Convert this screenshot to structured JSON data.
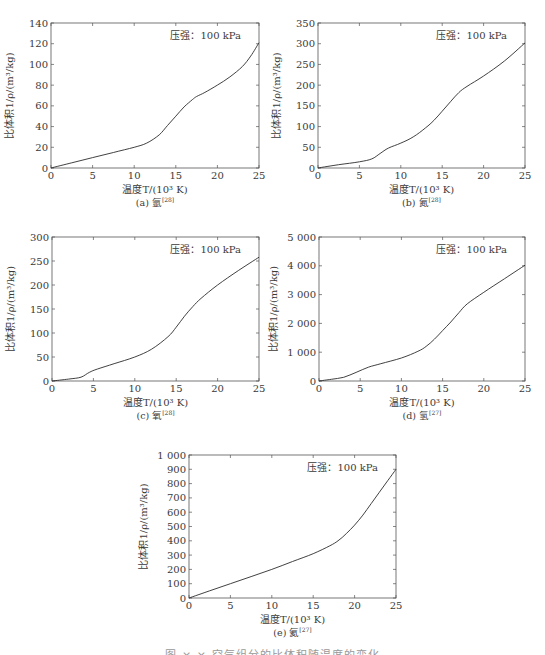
{
  "figure_caption": "图 ×-× 空气组分的比体积随温度的变化",
  "chart_data": [
    {
      "id": "a",
      "type": "line",
      "caption_label": "(a) 氩",
      "caption_ref": "[28]",
      "annotation": "压强：100 kPa",
      "xlabel": "温度T/(10³ K)",
      "ylabel": "比体积1/ρ/(m³/kg)",
      "xlim": [
        0,
        25
      ],
      "ylim": [
        0,
        140
      ],
      "xticks": [
        0,
        5,
        10,
        15,
        20,
        25
      ],
      "yticks": [
        0,
        20,
        40,
        60,
        80,
        100,
        120,
        140
      ],
      "ytick_labels": [
        "0",
        "20",
        "40",
        "60",
        "80",
        "100",
        "120",
        "140"
      ],
      "x": [
        0,
        2.5,
        5,
        7.5,
        10,
        11.5,
        13,
        14,
        15,
        16,
        17,
        17.5,
        18.5,
        20,
        21.5,
        23,
        24,
        25
      ],
      "y": [
        0,
        5,
        10,
        15,
        20,
        24,
        32,
        41,
        50,
        59,
        66,
        69,
        73,
        80,
        88,
        98,
        108,
        121
      ],
      "grid": false
    },
    {
      "id": "b",
      "type": "line",
      "caption_label": "(b) 氮",
      "caption_ref": "[28]",
      "annotation": "压强：100 kPa",
      "xlabel": "温度T/(10³ K)",
      "ylabel": "比体积1/ρ/(m³/kg)",
      "xlim": [
        0,
        25
      ],
      "ylim": [
        0,
        350
      ],
      "xticks": [
        0,
        5,
        10,
        15,
        20,
        25
      ],
      "yticks": [
        0,
        50,
        100,
        150,
        200,
        250,
        300,
        350
      ],
      "ytick_labels": [
        "0",
        "50",
        "100",
        "150",
        "200",
        "250",
        "300",
        "350"
      ],
      "x": [
        0,
        2.5,
        5,
        6.5,
        7.5,
        8.5,
        10,
        11.5,
        13,
        14,
        15,
        16,
        17,
        18,
        20,
        22.5,
        25
      ],
      "y": [
        0,
        8,
        15,
        22,
        35,
        48,
        60,
        75,
        97,
        115,
        137,
        160,
        182,
        197,
        222,
        258,
        302
      ],
      "grid": false
    },
    {
      "id": "c",
      "type": "line",
      "caption_label": "(c) 氧",
      "caption_ref": "[28]",
      "annotation": "压强：100 kPa",
      "xlabel": "温度T/(10³ K)",
      "ylabel": "比体积1/ρ/(m³/kg)",
      "xlim": [
        0,
        25
      ],
      "ylim": [
        0,
        300
      ],
      "xticks": [
        0,
        5,
        10,
        15,
        20,
        25
      ],
      "yticks": [
        0,
        50,
        100,
        150,
        200,
        250,
        300
      ],
      "ytick_labels": [
        "0",
        "50",
        "100",
        "150",
        "200",
        "250",
        "300"
      ],
      "x": [
        0,
        2,
        3.5,
        4.5,
        5.5,
        7.5,
        10,
        12,
        14,
        15,
        16,
        17,
        18,
        20,
        22.5,
        25
      ],
      "y": [
        0,
        4,
        8,
        18,
        25,
        36,
        50,
        66,
        92,
        112,
        135,
        155,
        172,
        200,
        230,
        258
      ],
      "grid": false
    },
    {
      "id": "d",
      "type": "line",
      "caption_label": "(d) 氢",
      "caption_ref": "[27]",
      "annotation": "压强：100 kPa",
      "xlabel": "温度T/(10³ K)",
      "ylabel": "比体积1/ρ/(m³/kg)",
      "xlim": [
        0,
        25
      ],
      "ylim": [
        0,
        5000
      ],
      "xticks": [
        0,
        5,
        10,
        15,
        20,
        25
      ],
      "yticks": [
        0,
        1000,
        2000,
        3000,
        4000,
        5000
      ],
      "ytick_labels": [
        "0",
        "1 000",
        "2 000",
        "3 000",
        "4 000",
        "5 000"
      ],
      "x": [
        0,
        1.5,
        3,
        4.5,
        6,
        7.5,
        10,
        12,
        13,
        14,
        15,
        16,
        17,
        18,
        20,
        22.5,
        25
      ],
      "y": [
        0,
        60,
        130,
        300,
        480,
        600,
        800,
        1030,
        1200,
        1450,
        1750,
        2050,
        2380,
        2680,
        3080,
        3550,
        4020
      ],
      "grid": false
    },
    {
      "id": "e",
      "type": "line",
      "caption_label": "(e) 氦",
      "caption_ref": "[27]",
      "annotation": "压强：100 kPa",
      "xlabel": "温度T/(10³ K)",
      "ylabel": "比体积1/ρ/(m³/kg)",
      "xlim": [
        0,
        25
      ],
      "ylim": [
        0,
        1000
      ],
      "xticks": [
        0,
        5,
        10,
        15,
        20,
        25
      ],
      "yticks": [
        0,
        100,
        200,
        300,
        400,
        500,
        600,
        700,
        800,
        900,
        1000
      ],
      "ytick_labels": [
        "0",
        "100",
        "200",
        "300",
        "400",
        "500",
        "600",
        "700",
        "800",
        "900",
        "1 000"
      ],
      "x": [
        0,
        2.5,
        5,
        7.5,
        10,
        12.5,
        15,
        17,
        18,
        19,
        20,
        21,
        22,
        23,
        24,
        25
      ],
      "y": [
        0,
        50,
        100,
        150,
        200,
        255,
        310,
        365,
        400,
        450,
        510,
        580,
        660,
        740,
        820,
        900
      ],
      "grid": false
    }
  ],
  "panels": [
    {
      "left": 51,
      "top": 23,
      "width": 208,
      "height": 145
    },
    {
      "left": 318,
      "top": 23,
      "width": 207,
      "height": 145
    },
    {
      "left": 52,
      "top": 237,
      "width": 207,
      "height": 144
    },
    {
      "left": 319,
      "top": 237,
      "width": 206,
      "height": 144
    },
    {
      "left": 189,
      "top": 455,
      "width": 207,
      "height": 143
    }
  ],
  "colors": {
    "axis": "#555555",
    "line": "#2b2b2b",
    "text": "#3a3a3a"
  }
}
